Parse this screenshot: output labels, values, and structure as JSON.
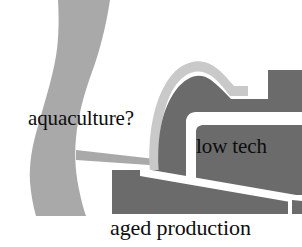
{
  "figure": {
    "type": "grayscale-map-sketch",
    "width": 302,
    "height": 247,
    "background_color": "#ffffff"
  },
  "colors": {
    "water_band": "#a9a9a9",
    "land_mass": "#6b6b6b",
    "outline_highlight": "#c9c9c9",
    "channel_white": "#ffffff",
    "text": "#0d0d0d"
  },
  "labels": {
    "aquaculture": "aquaculture?",
    "low_tech": "low tech",
    "aged_production": "aged production"
  },
  "regions": [
    {
      "name": "water-band",
      "label": "aquaculture?",
      "fill": "#a9a9a9",
      "description": "curving light gray band running from top to bottom on the left side"
    },
    {
      "name": "land-mass",
      "label": "low tech",
      "fill": "#6b6b6b",
      "description": "dark gray landform on the right with white channel inlets"
    },
    {
      "name": "lower-land-mass",
      "label": "aged production",
      "fill": "#6b6b6b",
      "description": "dark gray band across the bottom split by a diagonal white channel"
    }
  ]
}
